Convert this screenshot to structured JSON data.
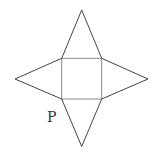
{
  "diagram": {
    "label": "P",
    "colors": {
      "edge": "#444444",
      "square": "#8a8a8a",
      "label": "#333333"
    },
    "points": {
      "top": [
        81.7,
        10
      ],
      "left": [
        15,
        79
      ],
      "right": [
        148,
        79
      ],
      "bottom": [
        81.7,
        146.5
      ],
      "sq_tl": [
        61.7,
        58.3
      ],
      "sq_tr": [
        101.7,
        58.3
      ],
      "sq_bl": [
        61.7,
        99
      ],
      "sq_br": [
        101.7,
        99
      ]
    }
  }
}
